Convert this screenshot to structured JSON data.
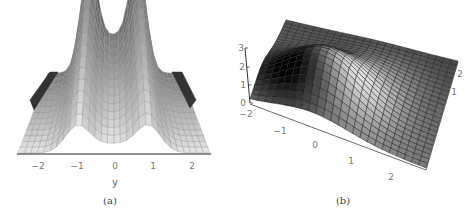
{
  "chart_data": [
    {
      "type": "surface",
      "panel": "a",
      "caption": "(a)",
      "view": "side view along y-axis",
      "xlabel": "y",
      "x_ticks": [
        "−2",
        "−1",
        "0",
        "1",
        "2"
      ],
      "x_range": [
        -2.5,
        2.5
      ],
      "description": "Bimodal surface with two peaks near y = -1 and y = 1, a dip at y = 0",
      "peaks_y": [
        -0.95,
        0.9
      ],
      "grid": true,
      "shading": "grayscale"
    },
    {
      "type": "surface",
      "panel": "b",
      "caption": "(b)",
      "view": "oblique 3D view",
      "z_ticks": [
        "0",
        "1",
        "2",
        "3"
      ],
      "z_range": [
        0,
        3
      ],
      "x_ticks": [
        "−2",
        "−1",
        "0",
        "1",
        "2"
      ],
      "y_ticks": [
        "2",
        "1",
        "0",
        "−1",
        "−2"
      ],
      "x_range": [
        -2,
        2
      ],
      "y_range": [
        -2,
        2
      ],
      "description": "Single-hump surface with maximum near the back corner, height up to ~3",
      "grid": true,
      "shading": "grayscale"
    }
  ],
  "panel_a": {
    "caption": "(a)",
    "axis_label": "y",
    "ticks": [
      {
        "label": "−2",
        "x": 38
      },
      {
        "label": "−1",
        "x": 77
      },
      {
        "label": "0",
        "x": 115
      },
      {
        "label": "1",
        "x": 153
      },
      {
        "label": "2",
        "x": 192
      }
    ]
  },
  "panel_b": {
    "caption": "(b)",
    "z_ticks": [
      {
        "label": "3",
        "x": 5,
        "y": 48
      },
      {
        "label": "2",
        "x": 6,
        "y": 67
      },
      {
        "label": "1",
        "x": 7,
        "y": 85
      },
      {
        "label": "0",
        "x": 7,
        "y": 103
      }
    ],
    "front_ticks": [
      {
        "label": "−2",
        "x": 10,
        "y": 114
      },
      {
        "label": "−1",
        "x": 44,
        "y": 131
      },
      {
        "label": "0",
        "x": 79,
        "y": 145
      },
      {
        "label": "1",
        "x": 115,
        "y": 161
      },
      {
        "label": "2",
        "x": 155,
        "y": 177
      }
    ],
    "side_ticks": [
      {
        "label": "2",
        "x": 224,
        "y": 74
      },
      {
        "label": "1",
        "x": 218,
        "y": 92
      },
      {
        "label": "0",
        "x": 203,
        "y": 110
      },
      {
        "label": "−1",
        "x": 186,
        "y": 132
      },
      {
        "label": "−2",
        "x": 178,
        "y": 156
      }
    ]
  }
}
